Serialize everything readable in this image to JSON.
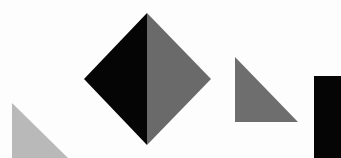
{
  "canvas": {
    "width": 341,
    "height": 158,
    "background": "#fdfdfd"
  },
  "colors": {
    "black": "#050505",
    "dark_gray": "#6a6a6a",
    "mid_gray": "#6e6e6e",
    "light_gray": "#b9b9b9"
  },
  "shapes": [
    {
      "name": "diamond-left-half",
      "type": "polygon",
      "points": "147,13 84,79 147,145",
      "fill": "black"
    },
    {
      "name": "diamond-right-half",
      "type": "polygon",
      "points": "147,13 211,79 147,145",
      "fill": "dark_gray"
    },
    {
      "name": "right-triangle-gray",
      "type": "polygon",
      "points": "235,57 235,122 298,122",
      "fill": "mid_gray"
    },
    {
      "name": "black-rectangle",
      "type": "polygon",
      "points": "314,76 341,76 341,158 314,158",
      "fill": "black"
    },
    {
      "name": "light-triangle",
      "type": "polygon",
      "points": "12,103 12,158 68,158",
      "fill": "light_gray"
    }
  ]
}
